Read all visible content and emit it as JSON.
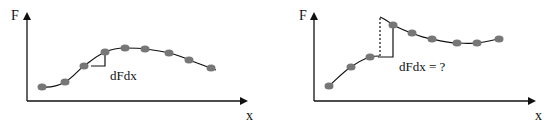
{
  "left_panel": {
    "y_label": "F",
    "x_label": "x",
    "annotation": "dFdx",
    "points": [
      [
        42,
        87
      ],
      [
        65,
        82
      ],
      [
        84,
        66
      ],
      [
        105,
        52
      ],
      [
        125,
        48
      ],
      [
        145,
        49
      ],
      [
        169,
        53
      ],
      [
        189,
        60
      ],
      [
        211,
        68
      ]
    ]
  },
  "right_panel": {
    "y_label": "F",
    "x_label": "x",
    "annotation": "dFdx = ?",
    "points_before": [
      [
        329,
        86
      ],
      [
        351,
        67
      ],
      [
        370,
        57
      ]
    ],
    "points_after": [
      [
        393,
        25
      ],
      [
        412,
        33
      ],
      [
        432,
        39
      ],
      [
        457,
        43
      ],
      [
        477,
        43
      ],
      [
        499,
        39
      ]
    ]
  },
  "colors": {
    "point": "#7a7a7a",
    "line": "#111111",
    "axis": "#111111"
  }
}
